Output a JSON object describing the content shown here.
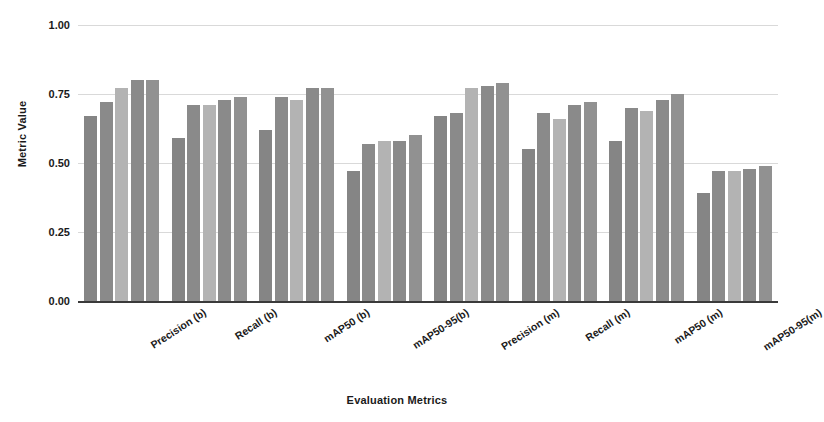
{
  "chart_data": {
    "type": "bar",
    "title": "",
    "xlabel": "Evaluation Metrics",
    "ylabel": "Metric Value",
    "ylim": [
      0,
      1.0
    ],
    "ytick_labels": [
      "1.00",
      "0.75",
      "0.50",
      "0.25",
      "0.00"
    ],
    "ytick_values": [
      1.0,
      0.75,
      0.5,
      0.25,
      0.0
    ],
    "grid": true,
    "legend": "none",
    "categories": [
      "Precision (b)",
      "Recall (b)",
      "mAP50 (b)",
      "mAP50-95(b)",
      "Precision (m)",
      "Recall (m)",
      "mAP50 (m)",
      "mAP50-95(m)"
    ],
    "series": [
      {
        "name": "Model 1",
        "color": "#858585",
        "values": [
          0.67,
          0.59,
          0.62,
          0.47,
          0.67,
          0.55,
          0.58,
          0.39
        ]
      },
      {
        "name": "Model 2",
        "color": "#8a8a8a",
        "values": [
          0.72,
          0.71,
          0.74,
          0.57,
          0.68,
          0.68,
          0.7,
          0.47
        ]
      },
      {
        "name": "Model 3",
        "color": "#b3b3b3",
        "values": [
          0.77,
          0.71,
          0.73,
          0.58,
          0.77,
          0.66,
          0.69,
          0.47
        ]
      },
      {
        "name": "Model 4",
        "color": "#8a8a8a",
        "values": [
          0.8,
          0.73,
          0.77,
          0.58,
          0.78,
          0.71,
          0.73,
          0.48
        ]
      },
      {
        "name": "Model 5",
        "color": "#919191",
        "values": [
          0.8,
          0.74,
          0.77,
          0.6,
          0.79,
          0.72,
          0.75,
          0.49
        ]
      }
    ]
  }
}
